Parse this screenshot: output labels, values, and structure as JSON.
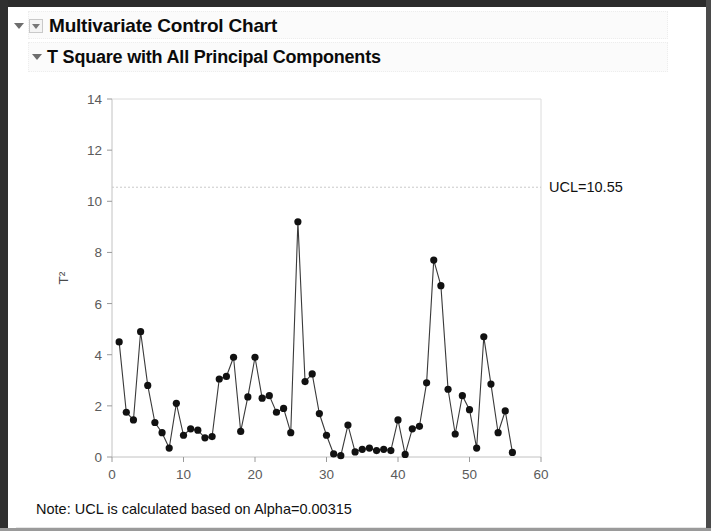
{
  "window": {
    "outline_title": "Multivariate Control Chart",
    "section_title": "T Square with All Principal Components",
    "note": "Note: UCL is calculated based on Alpha=0.00315"
  },
  "icons": {
    "outer_disclosure": "triangle-down-icon",
    "outer_disclosure_box": "triangle-down-boxed-icon",
    "inner_disclosure": "triangle-down-icon"
  },
  "chart_data": {
    "type": "line",
    "title": "T Square with All Principal Components",
    "xlabel": "Sample",
    "ylabel": "T²",
    "xlim": [
      0,
      60
    ],
    "ylim": [
      0,
      14
    ],
    "xticks": [
      0,
      10,
      20,
      30,
      40,
      50,
      60
    ],
    "yticks": [
      0,
      2,
      4,
      6,
      8,
      10,
      12,
      14
    ],
    "grid": false,
    "legend": null,
    "marker": "filled-circle",
    "line_color": "#3a3a3a",
    "marker_color": "#111111",
    "annotations": [
      {
        "name": "ucl-line",
        "label": "UCL=10.55",
        "value": 10.55,
        "orientation": "horizontal",
        "style": "dashed",
        "color": "#c9c9c9"
      }
    ],
    "x": [
      1,
      2,
      3,
      4,
      5,
      6,
      7,
      8,
      9,
      10,
      11,
      12,
      13,
      14,
      15,
      16,
      17,
      18,
      19,
      20,
      21,
      22,
      23,
      24,
      25,
      26,
      27,
      28,
      29,
      30,
      31,
      32,
      33,
      34,
      35,
      36,
      37,
      38,
      39,
      40,
      41,
      42,
      43,
      44,
      45,
      46,
      47,
      48,
      49,
      50,
      51,
      52,
      53,
      54,
      55,
      56
    ],
    "values": [
      4.5,
      1.75,
      1.45,
      4.9,
      2.8,
      1.35,
      0.95,
      0.35,
      2.1,
      0.85,
      1.1,
      1.05,
      0.75,
      0.8,
      3.05,
      3.15,
      3.9,
      1.0,
      2.35,
      3.9,
      2.3,
      2.4,
      1.75,
      1.9,
      0.95,
      9.2,
      2.95,
      3.25,
      1.7,
      0.85,
      0.12,
      0.05,
      1.25,
      0.2,
      0.3,
      0.35,
      0.25,
      0.3,
      0.25,
      1.45,
      0.1,
      1.1,
      1.2,
      2.9,
      7.7,
      6.7,
      2.65,
      0.9,
      2.4,
      1.85,
      0.35,
      4.7,
      2.85,
      0.95,
      1.8,
      0.18
    ]
  }
}
